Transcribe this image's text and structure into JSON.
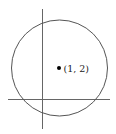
{
  "diagram": {
    "title": "",
    "point": {
      "label": "(1, 2)",
      "x": 1,
      "y": 2
    },
    "shapes": [
      "circle centered at (1, 2)",
      "x-axis",
      "y-axis"
    ],
    "colors": {
      "stroke": "#555555",
      "point": "#000000",
      "background": "#ffffff"
    }
  }
}
